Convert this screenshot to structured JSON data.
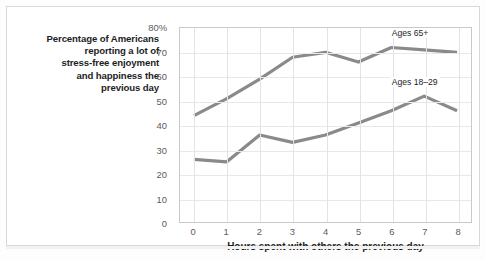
{
  "chart_data": {
    "type": "line",
    "title": "",
    "ylabel": "Percentage of Americans reporting a lot of stress-free enjoyment and happiness the previous day",
    "ylabel_lines": [
      "Percentage of Americans",
      "reporting a lot of",
      "stress-free enjoyment",
      "and happiness the",
      "previous day"
    ],
    "xlabel": "Hours spent with others the previous day",
    "categories": [
      "0",
      "1",
      "2",
      "3",
      "4",
      "5",
      "6",
      "7",
      "8"
    ],
    "x": [
      0,
      1,
      2,
      3,
      4,
      5,
      6,
      7,
      8
    ],
    "xlim": [
      0,
      8
    ],
    "ylim": [
      0,
      80
    ],
    "ytick_labels": [
      "0",
      "10",
      "20",
      "30",
      "40",
      "50",
      "60",
      "70",
      "80%"
    ],
    "ytick_values": [
      0,
      10,
      20,
      30,
      40,
      50,
      60,
      70,
      80
    ],
    "grid": "both",
    "legend_position": "inline-annotation",
    "series": [
      {
        "name": "Ages 65+",
        "values": [
          44,
          51,
          59,
          68,
          70,
          66,
          72,
          71,
          70
        ],
        "color": "#8a8a8a",
        "label_x": 6,
        "label_y": 77
      },
      {
        "name": "Ages 18–29",
        "values": [
          26,
          25,
          36,
          33,
          36,
          41,
          46,
          52,
          46
        ],
        "color": "#8a8a8a",
        "label_x": 6,
        "label_y": 57
      }
    ]
  },
  "style": {
    "line_color": "#8a8a8a",
    "grid_color": "#e3e3e3",
    "axis_border_color": "#c9c9c9",
    "tick_text_color": "#5b5b5b",
    "title_text_color": "#1d1d1d",
    "card_background": "#ffffff",
    "page_background": "#fdfdfd"
  }
}
